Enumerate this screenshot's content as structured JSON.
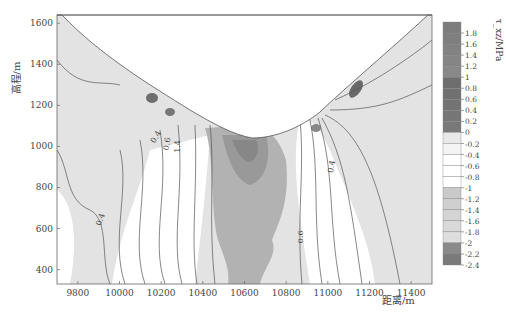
{
  "chart_data": {
    "type": "heatmap",
    "subtype": "filled contour (shear stress cross-section of a valley)",
    "title": "",
    "xlabel": "距离/m",
    "ylabel": "高程/m",
    "xlim": [
      9700,
      11500
    ],
    "ylim": [
      330,
      1640
    ],
    "xticks": [
      9800,
      10000,
      10200,
      10400,
      10600,
      10800,
      11000,
      11200,
      11400
    ],
    "yticks": [
      400,
      600,
      800,
      1000,
      1200,
      1400,
      1600
    ],
    "grid": false,
    "colorbar": {
      "label": "τ_xz/MPa",
      "position": "right",
      "ticks": [
        "1.8",
        "1.6",
        "1.4",
        "1.2",
        "1",
        "0.8",
        "0.6",
        "0.4",
        "0.2",
        "0",
        "-0.2",
        "-0.4",
        "-0.6",
        "-0.8",
        "-1",
        "-1.2",
        "-1.4",
        "-1.6",
        "-1.8",
        "-2",
        "-2.2",
        "-2.4"
      ],
      "levels": [
        2.0,
        1.8,
        1.6,
        1.4,
        1.2,
        1.0,
        0.8,
        0.6,
        0.4,
        0.2,
        0,
        -0.2,
        -0.4,
        -0.6,
        -0.8,
        -1.0,
        -1.2,
        -1.4,
        -1.6,
        -1.8,
        -2.0,
        -2.2,
        -2.4
      ],
      "band_colors": [
        "#7d7d7d",
        "#7f7f7f",
        "#828282",
        "#858585",
        "#888888",
        "#6e6e6e",
        "#707070",
        "#737373",
        "#767676",
        "#797979",
        "#e9e9e9",
        "#f4f4f4",
        "#ffffff",
        "#ffffff",
        "#ffffff",
        "#c9c9c9",
        "#cfcfcf",
        "#d4d4d4",
        "#d9d9d9",
        "#dedede",
        "#8a8a8a",
        "#7a7a7a"
      ]
    },
    "contour_labels": [
      {
        "text": "0.4",
        "x": 9920,
        "y": 640,
        "rotation": -70
      },
      {
        "text": "0.4",
        "x": 10185,
        "y": 1040,
        "rotation": -60
      },
      {
        "text": "0.6",
        "x": 10240,
        "y": 1010,
        "rotation": -80
      },
      {
        "text": "1.4",
        "x": 10290,
        "y": 1000,
        "rotation": -90
      },
      {
        "text": "0.6",
        "x": 10880,
        "y": 560,
        "rotation": -90
      },
      {
        "text": "0.4",
        "x": 11030,
        "y": 900,
        "rotation": -80
      }
    ],
    "surface_profile": {
      "description": "valley ground surface; region above is blank (air)",
      "points": [
        [
          9700,
          1640
        ],
        [
          9800,
          1520
        ],
        [
          10000,
          1380
        ],
        [
          10150,
          1210
        ],
        [
          10300,
          1080
        ],
        [
          10450,
          960
        ],
        [
          10600,
          930
        ],
        [
          10750,
          960
        ],
        [
          10950,
          1050
        ],
        [
          11050,
          1150
        ],
        [
          11150,
          1300
        ],
        [
          11300,
          1440
        ],
        [
          11450,
          1620
        ],
        [
          11500,
          1640
        ]
      ]
    },
    "regions": [
      {
        "name": "left slope far field",
        "value_range": "-1.8 to -1.0",
        "shade": "light gray"
      },
      {
        "name": "right slope far field",
        "value_range": "-1.8 to -1.0",
        "shade": "light gray"
      },
      {
        "name": "under valley bottom",
        "value_range": "-1.4 to -2.4",
        "shade": "medium-dark gray",
        "x_range": [
          10400,
          10850
        ],
        "y_range": [
          330,
          960
        ]
      },
      {
        "name": "fanning contours left of valley",
        "value_range": "-0.2 to -1.0",
        "shade": "white"
      },
      {
        "name": "fanning contours right of valley",
        "value_range": "-0.2 to -1.0",
        "shade": "white"
      },
      {
        "name": "stress concentration left slope",
        "x": 10200,
        "y": 1170,
        "value_range": "0.2 to 1.0",
        "shade": "dark gray"
      },
      {
        "name": "stress concentration right slope",
        "x": 11120,
        "y": 1220,
        "value_range": "0.2 to 1.0",
        "shade": "dark gray"
      }
    ]
  }
}
